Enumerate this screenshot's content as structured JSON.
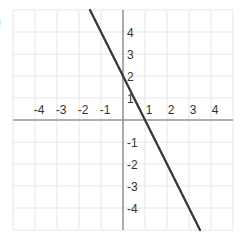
{
  "figure_label": ")",
  "chart_data": {
    "type": "line",
    "title": "",
    "xlabel": "",
    "ylabel": "",
    "xlim": [
      -5,
      5
    ],
    "ylim": [
      -5,
      5
    ],
    "grid": true,
    "x_ticks": [
      -4,
      -3,
      -2,
      -1,
      1,
      2,
      3,
      4
    ],
    "y_ticks": [
      4,
      3,
      2,
      1,
      -1,
      -2,
      -3,
      -4
    ],
    "x_tick_labels": [
      "-4",
      "-3",
      "-2",
      "-1",
      "1",
      "2",
      "3",
      "4"
    ],
    "y_tick_labels": [
      "4",
      "3",
      "2",
      "1",
      "-1",
      "-2",
      "-3",
      "-4"
    ],
    "series": [
      {
        "name": "line",
        "equation": "y = -2x + 2",
        "slope": -2,
        "y_intercept": 2,
        "x_intercept": 1,
        "x": [
          -1.5,
          3.5
        ],
        "y": [
          5,
          -5
        ],
        "color": "#333333"
      }
    ],
    "colors": {
      "grid": "#e6e6e6",
      "axis": "#999999",
      "line": "#333333",
      "label": "#333333"
    }
  }
}
